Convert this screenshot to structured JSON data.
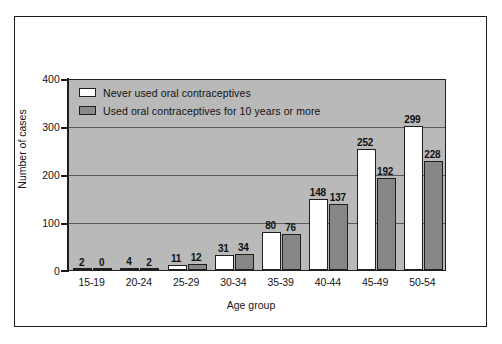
{
  "chart_data": {
    "type": "bar",
    "title": "",
    "subtitle": "",
    "xlabel": "Age group",
    "ylabel": "Number of cases",
    "categories": [
      "15-19",
      "20-24",
      "25-29",
      "30-34",
      "35-39",
      "40-44",
      "45-49",
      "50-54"
    ],
    "series": [
      {
        "name": "Never used oral contraceptives",
        "color": "#ffffff",
        "values": [
          2,
          4,
          11,
          31,
          80,
          148,
          252,
          299
        ]
      },
      {
        "name": "Used oral contraceptives for 10 years or more",
        "color": "#878787",
        "values": [
          0,
          2,
          12,
          34,
          76,
          137,
          192,
          228
        ]
      }
    ],
    "ylim": [
      0,
      400
    ],
    "yticks": [
      0,
      100,
      200,
      300,
      400
    ],
    "ytick_labels": [
      "0",
      "100",
      "200",
      "300",
      "400"
    ],
    "grid": true,
    "grid_axis": "y",
    "legend_position": "top-left-inside",
    "data_labels": true,
    "plot_background_color": "#b9b9b9",
    "frame_color": "#1b1b1b"
  },
  "legend": {
    "items": [
      {
        "label": "Never used oral contraceptives",
        "swatch": "white-swatch"
      },
      {
        "label": "Used oral contraceptives for 10 years or more",
        "swatch": "gray-swatch"
      }
    ]
  },
  "axes": {
    "y_title": "Number of cases",
    "x_title": "Age group"
  }
}
